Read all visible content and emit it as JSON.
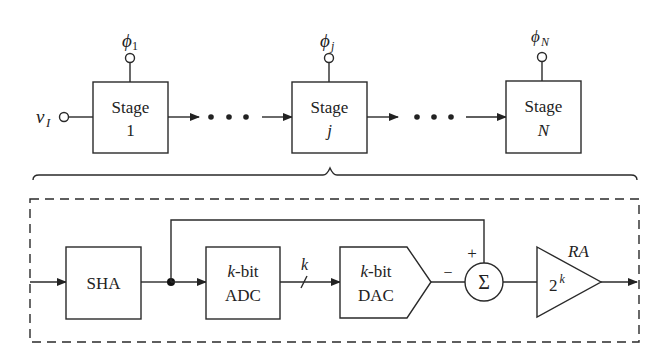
{
  "diagram": {
    "input_label": "v",
    "input_sub": "I",
    "ellipsis": "• • •",
    "stages": [
      {
        "label": "Stage",
        "index": "1",
        "clock": "ϕ",
        "clock_sub": "1"
      },
      {
        "label": "Stage",
        "index": "j",
        "clock": "ϕ",
        "clock_sub": "j"
      },
      {
        "label": "Stage",
        "index": "N",
        "clock": "ϕ",
        "clock_sub": "N"
      }
    ],
    "stage_detail": {
      "sha": "SHA",
      "adc": {
        "line1_var": "k",
        "line1_rest": "-bit",
        "line2": "ADC"
      },
      "bus_label": "k",
      "dac": {
        "line1_var": "k",
        "line1_rest": "-bit",
        "line2": "DAC"
      },
      "sum_symbol": "Σ",
      "sum_plus": "+",
      "sum_minus": "−",
      "amp_gain_base": "2",
      "amp_gain_exp": "k",
      "amp_label": "RA"
    }
  }
}
